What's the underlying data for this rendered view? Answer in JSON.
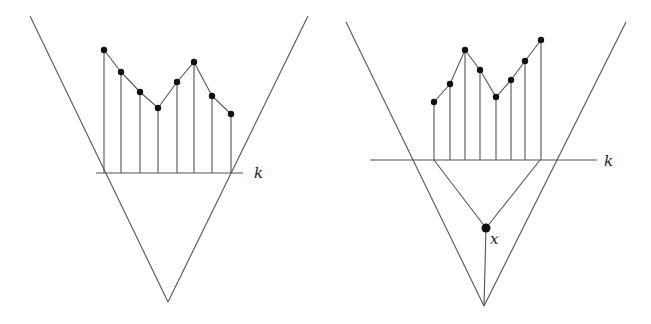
{
  "figures": [
    {
      "id": "left",
      "v_lines": [
        [
          30,
          16,
          168,
          302
        ],
        [
          308,
          16,
          168,
          302
        ]
      ],
      "baseline": {
        "x1": 96,
        "x2": 243,
        "y": 173,
        "label": "k",
        "label_x": 254,
        "label_y": 178
      },
      "points": [
        [
          104,
          50
        ],
        [
          121,
          72
        ],
        [
          140,
          92
        ],
        [
          158,
          108
        ],
        [
          177,
          82
        ],
        [
          194,
          62
        ],
        [
          212,
          96
        ],
        [
          231,
          114
        ]
      ]
    },
    {
      "id": "right",
      "v_lines": [
        [
          346,
          22,
          484,
          306
        ],
        [
          626,
          22,
          484,
          306
        ]
      ],
      "baseline": {
        "x1": 370,
        "x2": 597,
        "y": 160,
        "label": "k",
        "label_x": 604,
        "label_y": 166
      },
      "points": [
        [
          434,
          102
        ],
        [
          450,
          84
        ],
        [
          465,
          50
        ],
        [
          480,
          70
        ],
        [
          496,
          97
        ],
        [
          511,
          80
        ],
        [
          525,
          61
        ],
        [
          541,
          40
        ]
      ],
      "inner_lines": [
        [
          434,
          160,
          486,
          228
        ],
        [
          540,
          160,
          486,
          228
        ],
        [
          486,
          228,
          484,
          306
        ]
      ],
      "node": {
        "x": 486,
        "y": 228,
        "r": 4.5,
        "label": "x",
        "label_x": 490,
        "label_y": 244
      }
    }
  ],
  "labels": {
    "k_left": "k",
    "k_right": "k",
    "x_node": "x"
  }
}
